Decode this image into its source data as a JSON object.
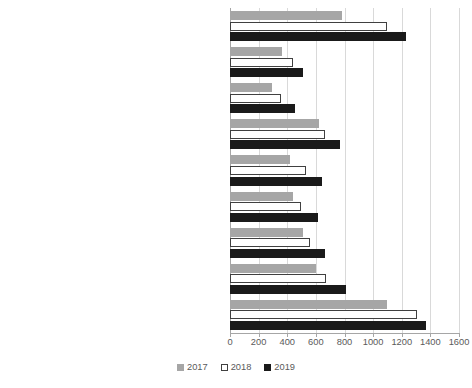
{
  "chart_data": {
    "type": "bar",
    "orientation": "horizontal",
    "title": "",
    "xlabel": "",
    "ylabel": "",
    "xlim": [
      0,
      1600
    ],
    "xticks": [
      0,
      200,
      400,
      600,
      800,
      1000,
      1200,
      1400,
      1600
    ],
    "xtick_labels": [
      "0",
      "200",
      "400",
      "600",
      "800",
      "1000",
      "1200",
      "1400",
      "1600"
    ],
    "grid": true,
    "legend_position": "bottom",
    "legend": [
      "2017",
      "2018",
      "2019"
    ],
    "categories": [
      "The number of enterprises that purchased cloud computing services from the shared service provider's servers",
      "computer power for the operation of enterprise software",
      "customer relationship management programs",
      "financial or accounting applications",
      "file storage service",
      "enterprise database hosting",
      "office software",
      "Email",
      "The umber of enterprises that bought cloud computing services"
    ],
    "series": [
      {
        "name": "2017",
        "color": "#a6a6a6",
        "values": [
          785,
          365,
          295,
          625,
          421,
          442,
          512,
          604,
          1100
        ]
      },
      {
        "name": "2018",
        "color": "#ffffff",
        "values": [
          1100,
          442,
          358,
          667,
          533,
          498,
          561,
          674,
          1305
        ]
      },
      {
        "name": "2019",
        "color": "#1a1a1a",
        "values": [
          1228,
          512,
          456,
          772,
          646,
          618,
          667,
          807,
          1368
        ]
      }
    ]
  },
  "legend": {
    "items": [
      {
        "label": "2017",
        "key": "y2017"
      },
      {
        "label": "2018",
        "key": "y2018"
      },
      {
        "label": "2019",
        "key": "y2019"
      }
    ]
  }
}
